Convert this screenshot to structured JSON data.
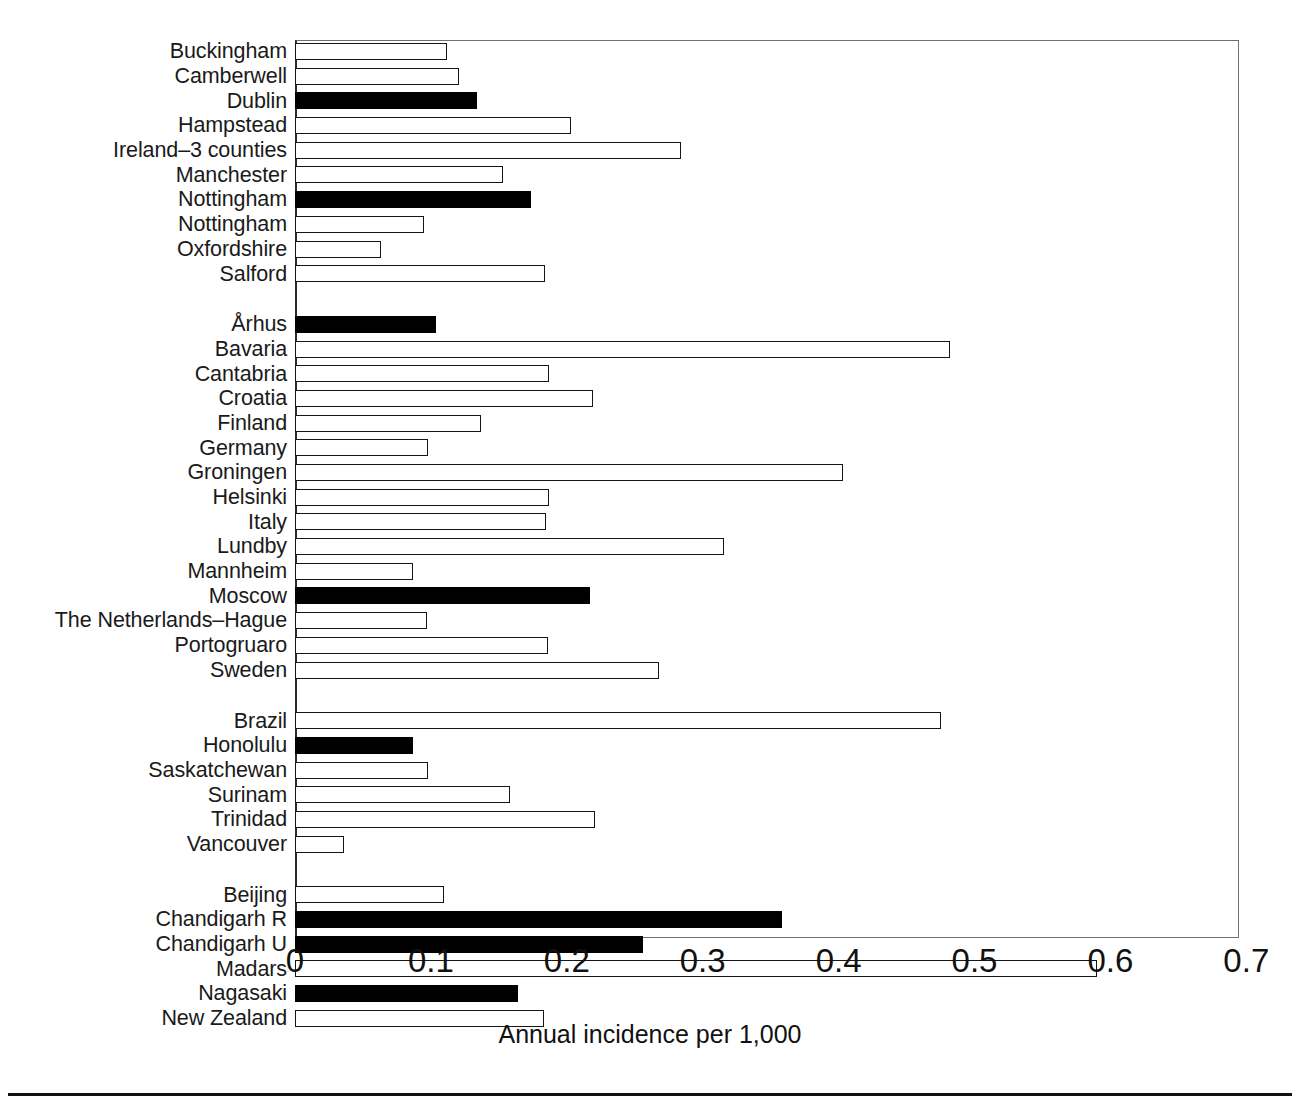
{
  "figure": {
    "axis_label": "Annual incidence per 1,000",
    "bar_fill_dark": "#000000",
    "bar_fill_light": "#ffffff",
    "bar_stroke": "#151515",
    "frame_stroke": "#6f6f6f"
  },
  "axis": {
    "ticks": [
      "0",
      "0.1",
      "0.2",
      "0.3",
      "0.4",
      "0.5",
      "0.6",
      "0.7"
    ],
    "min": 0,
    "max": 0.7
  },
  "chart_data": {
    "type": "bar",
    "orientation": "horizontal",
    "title": "",
    "xlabel": "Annual incidence per 1,000",
    "ylabel": "",
    "xlim": [
      0,
      0.7
    ],
    "xticks": [
      0,
      0.1,
      0.2,
      0.3,
      0.4,
      0.5,
      0.6,
      0.7
    ],
    "grid": false,
    "legend": [],
    "note": "Filled (black) bars denote one subset of studies; open (white) bars the other.",
    "groups": [
      {
        "name": "British Isles",
        "categories": [
          "Buckingham",
          "Camberwell",
          "Dublin",
          "Hampstead",
          "Ireland–3 counties",
          "Manchester",
          "Nottingham",
          "Nottingham",
          "Oxfordshire",
          "Salford"
        ],
        "values": [
          0.112,
          0.121,
          0.134,
          0.203,
          0.284,
          0.153,
          0.174,
          0.095,
          0.063,
          0.184
        ],
        "filled": [
          false,
          false,
          true,
          false,
          false,
          false,
          true,
          false,
          false,
          false
        ]
      },
      {
        "name": "Europe",
        "categories": [
          "Århus",
          "Bavaria",
          "Cantabria",
          "Croatia",
          "Finland",
          "Germany",
          "Groningen",
          "Helsinki",
          "Italy",
          "Lundby",
          "Mannheim",
          "Moscow",
          "The Netherlands–Hague",
          "Portogruaro",
          "Sweden"
        ],
        "values": [
          0.104,
          0.482,
          0.187,
          0.219,
          0.137,
          0.098,
          0.403,
          0.187,
          0.185,
          0.316,
          0.087,
          0.217,
          0.097,
          0.186,
          0.268
        ],
        "filled": [
          true,
          false,
          false,
          false,
          false,
          false,
          false,
          false,
          false,
          false,
          false,
          true,
          false,
          false,
          false
        ]
      },
      {
        "name": "Americas",
        "categories": [
          "Brazil",
          "Honolulu",
          "Saskatchewan",
          "Surinam",
          "Trinidad",
          "Vancouver"
        ],
        "values": [
          0.475,
          0.087,
          0.098,
          0.158,
          0.221,
          0.036
        ],
        "filled": [
          false,
          true,
          false,
          false,
          false,
          false
        ]
      },
      {
        "name": "Asia / Oceania",
        "categories": [
          "Beijing",
          "Chandigarh R",
          "Chandigarh U",
          "Madars",
          "Nagasaki",
          "New Zealand"
        ],
        "values": [
          0.11,
          0.358,
          0.256,
          0.59,
          0.164,
          0.183
        ],
        "filled": [
          false,
          true,
          true,
          false,
          true,
          false
        ]
      }
    ]
  }
}
